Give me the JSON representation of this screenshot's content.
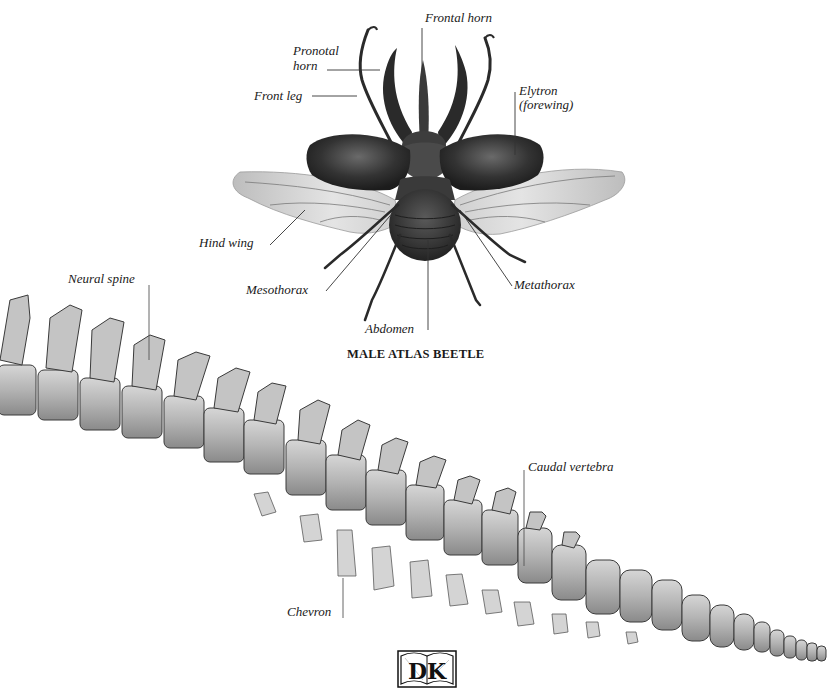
{
  "figures": {
    "beetle": {
      "title": "MALE ATLAS BEETLE",
      "labels": {
        "frontal_horn": "Frontal horn",
        "pronotal_horn_line1": "Pronotal",
        "pronotal_horn_line2": "horn",
        "front_leg": "Front leg",
        "elytron_line1": "Elytron",
        "elytron_line2": "(forewing)",
        "hind_wing": "Hind wing",
        "mesothorax": "Mesothorax",
        "metathorax": "Metathorax",
        "abdomen": "Abdomen"
      }
    },
    "spine": {
      "labels": {
        "neural_spine": "Neural spine",
        "caudal_vertebra": "Caudal vertebra",
        "chevron": "Chevron"
      }
    }
  },
  "publisher_logo": {
    "letters": "DK",
    "icon": "open-book-icon"
  },
  "colors": {
    "background": "#ffffff",
    "label_text": "#1a1a1a",
    "leader_line": "#333333",
    "bone_light": "#cfcfcf",
    "bone_dark": "#6e6e6e",
    "beetle_dark": "#2b2b2b",
    "wing_light": "#d9d9d9"
  }
}
